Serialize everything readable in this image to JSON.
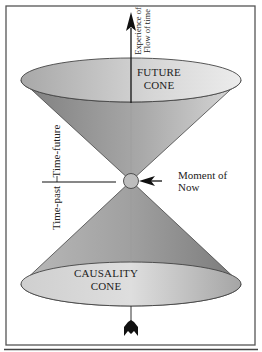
{
  "diagram": {
    "future_cone": {
      "line1": "FUTURE",
      "line2": "CONE"
    },
    "causality_cone": {
      "line1": "CAUSALITY",
      "line2": "CONE"
    },
    "time_axis": {
      "line1": "Experience of",
      "line2": "Flow of time"
    },
    "time_future_label": "Time-future",
    "time_past_label": "Time-past",
    "now_label": {
      "line1": "Moment of",
      "line2": "Now"
    },
    "colors": {
      "cone_dark": "#7e7e7e",
      "cone_light": "#d8d8d8",
      "face_dark": "#a8a8a8",
      "face_light": "#ececec",
      "ink": "#111111"
    }
  }
}
